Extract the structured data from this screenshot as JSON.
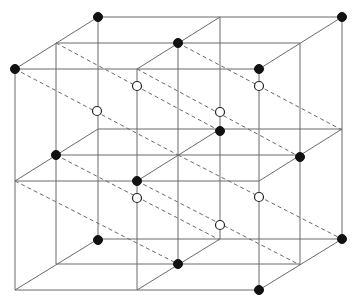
{
  "diagram": {
    "type": "crystal-lattice-2x2x2",
    "colors": {
      "line": "#6a6a6a",
      "filled_node": "#111111",
      "open_node": "#ffffff",
      "background": "#ffffff"
    },
    "grid": {
      "front_x": [
        15,
        137,
        259
      ],
      "front_y": [
        69,
        181,
        290
      ],
      "depth_offset_per_layer": [
        41.5,
        -26
      ]
    },
    "solid_edges": [
      [
        15,
        69,
        259,
        69
      ],
      [
        15,
        181,
        259,
        181
      ],
      [
        15,
        290,
        259,
        290
      ],
      [
        56,
        43,
        300,
        43
      ],
      [
        56,
        155,
        300,
        155
      ],
      [
        56,
        264,
        300,
        264
      ],
      [
        98,
        17,
        342,
        17
      ],
      [
        98,
        129,
        342,
        129
      ],
      [
        98,
        239,
        342,
        239
      ],
      [
        15,
        69,
        15,
        290
      ],
      [
        137,
        69,
        137,
        290
      ],
      [
        259,
        69,
        259,
        290
      ],
      [
        56,
        43,
        56,
        264
      ],
      [
        178,
        43,
        178,
        264
      ],
      [
        300,
        43,
        300,
        264
      ],
      [
        98,
        17,
        98,
        239
      ],
      [
        220,
        17,
        220,
        239
      ],
      [
        342,
        17,
        342,
        239
      ],
      [
        15,
        69,
        98,
        17
      ],
      [
        137,
        69,
        220,
        17
      ],
      [
        259,
        69,
        342,
        17
      ],
      [
        15,
        181,
        98,
        129
      ],
      [
        137,
        181,
        220,
        129
      ],
      [
        259,
        181,
        342,
        129
      ],
      [
        15,
        290,
        98,
        239
      ],
      [
        137,
        290,
        220,
        239
      ],
      [
        259,
        290,
        342,
        239
      ]
    ],
    "dashed_edges": [
      [
        56,
        43,
        220,
        131
      ],
      [
        178,
        43,
        342,
        130
      ],
      [
        15,
        69,
        178,
        155
      ],
      [
        137,
        69,
        300,
        157
      ],
      [
        56,
        155,
        220,
        240
      ],
      [
        178,
        155,
        342,
        239
      ],
      [
        137,
        181,
        300,
        265
      ],
      [
        15,
        181,
        178,
        264
      ]
    ],
    "filled_nodes": [
      [
        98,
        17
      ],
      [
        342,
        17
      ],
      [
        15,
        69
      ],
      [
        259,
        69
      ],
      [
        178,
        43
      ],
      [
        220,
        131
      ],
      [
        56,
        155
      ],
      [
        300,
        157
      ],
      [
        137,
        181
      ],
      [
        98,
        240
      ],
      [
        342,
        239
      ],
      [
        178,
        264
      ],
      [
        259,
        290
      ]
    ],
    "open_nodes": [
      [
        97,
        111
      ],
      [
        137,
        86
      ],
      [
        220,
        112
      ],
      [
        259,
        86
      ],
      [
        137,
        198
      ],
      [
        220,
        225
      ],
      [
        259,
        197
      ]
    ]
  }
}
